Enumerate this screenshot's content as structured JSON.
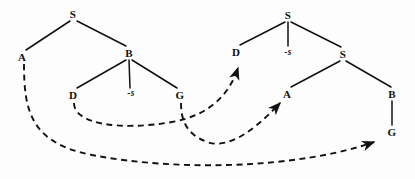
{
  "figure": {
    "width": 415,
    "height": 179,
    "background_color": "#fdfdfd",
    "ink_color": "#111111"
  },
  "trees": [
    {
      "id": "left-tree",
      "name": "left-tree",
      "nodes": [
        {
          "id": "L-S",
          "label": "S",
          "x": 73,
          "y": 14,
          "kind": "nonterminal"
        },
        {
          "id": "L-A",
          "label": "A",
          "x": 22,
          "y": 57,
          "kind": "terminal"
        },
        {
          "id": "L-B",
          "label": "B",
          "x": 129,
          "y": 53,
          "kind": "nonterminal"
        },
        {
          "id": "L-D",
          "label": "D",
          "x": 73,
          "y": 95,
          "kind": "terminal"
        },
        {
          "id": "L-trace",
          "label": "-s",
          "x": 131,
          "y": 94,
          "kind": "trace"
        },
        {
          "id": "L-G",
          "label": "G",
          "x": 180,
          "y": 95,
          "kind": "terminal"
        }
      ],
      "edges": [
        {
          "from": "L-S",
          "to": "L-A"
        },
        {
          "from": "L-S",
          "to": "L-B"
        },
        {
          "from": "L-B",
          "to": "L-D"
        },
        {
          "from": "L-B",
          "to": "L-trace"
        },
        {
          "from": "L-B",
          "to": "L-G"
        }
      ]
    },
    {
      "id": "right-tree",
      "name": "right-tree",
      "nodes": [
        {
          "id": "R-S1",
          "label": "S",
          "x": 288,
          "y": 15,
          "kind": "nonterminal"
        },
        {
          "id": "R-D",
          "label": "D",
          "x": 236,
          "y": 52,
          "kind": "terminal"
        },
        {
          "id": "R-trace",
          "label": "-s",
          "x": 288,
          "y": 53,
          "kind": "trace"
        },
        {
          "id": "R-S2",
          "label": "S",
          "x": 343,
          "y": 54,
          "kind": "nonterminal"
        },
        {
          "id": "R-A",
          "label": "A",
          "x": 287,
          "y": 94,
          "kind": "terminal"
        },
        {
          "id": "R-B",
          "label": "B",
          "x": 392,
          "y": 94,
          "kind": "nonterminal"
        },
        {
          "id": "R-G",
          "label": "G",
          "x": 392,
          "y": 132,
          "kind": "terminal"
        }
      ],
      "edges": [
        {
          "from": "R-S1",
          "to": "R-D"
        },
        {
          "from": "R-S1",
          "to": "R-trace"
        },
        {
          "from": "R-S1",
          "to": "R-S2"
        },
        {
          "from": "R-S2",
          "to": "R-A"
        },
        {
          "from": "R-S2",
          "to": "R-B"
        },
        {
          "from": "R-B",
          "to": "R-G"
        }
      ]
    }
  ],
  "correspondence_arrows": [
    {
      "id": "arrow-D-to-D",
      "name": "dashed-arrow-left-D-to-right-D",
      "from_label": "D",
      "to_label": "D",
      "style": "dashed",
      "has_arrowhead": true,
      "path": "M 74 103 C 74 124, 120 131, 172 122 C 212 115, 230 92, 238 68"
    },
    {
      "id": "arrow-A-to-G",
      "name": "dashed-arrow-left-A-to-right-G",
      "from_label": "A",
      "to_label": "G",
      "style": "dashed",
      "has_arrowhead": true,
      "path": "M 24 64 C 24 110, 30 143, 92 155 C 180 172, 300 168, 374 142"
    },
    {
      "id": "arrow-G-to-A",
      "name": "dashed-arrow-left-G-to-right-A",
      "from_label": "G",
      "to_label": "A",
      "style": "dashed",
      "has_arrowhead": true,
      "path": "M 181 103 C 181 120, 186 134, 207 142 C 232 151, 262 122, 280 103"
    }
  ]
}
